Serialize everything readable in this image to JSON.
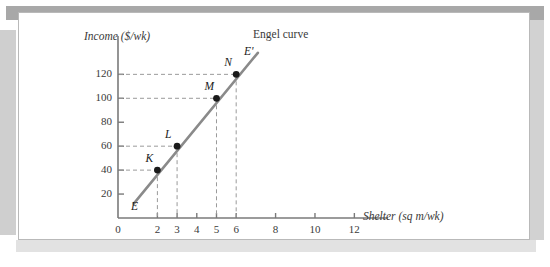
{
  "figure": {
    "background": "#ffffff",
    "frame_color": "#a8a8a8",
    "panel_border": "#b9b9b9"
  },
  "chart_data": {
    "type": "line",
    "title": "",
    "subtitle": "",
    "xlabel": "Shelter (sq m/wk)",
    "ylabel": "Income ($/wk)",
    "xlim": [
      0,
      13.2
    ],
    "ylim": [
      0,
      137
    ],
    "grid": false,
    "legend": "none",
    "line_color": "#8a8a8a",
    "point_color": "#1a1a1a",
    "guide_color": "#9a9a9a",
    "axis_color": "#7a7a7a",
    "xticks": [
      0,
      2,
      3,
      4,
      5,
      6,
      8,
      10,
      12
    ],
    "xtick_labels": [
      "0",
      "2",
      "3",
      "4",
      "5",
      "6",
      "8",
      "10",
      "12"
    ],
    "yticks": [
      20,
      40,
      60,
      80,
      100,
      120
    ],
    "ytick_labels": [
      "20",
      "40",
      "60",
      "80",
      "100",
      "120"
    ],
    "series": [
      {
        "name": "Engel curve",
        "label": "Engel curve",
        "start_label": "E",
        "end_label": "E'",
        "line_from": [
          0.8,
          12
        ],
        "line_to": [
          7.1,
          138
        ],
        "points": [
          {
            "label": "K",
            "x": 2,
            "y": 40
          },
          {
            "label": "L",
            "x": 3,
            "y": 60
          },
          {
            "label": "M",
            "x": 5,
            "y": 100
          },
          {
            "label": "N",
            "x": 6,
            "y": 120
          }
        ]
      }
    ],
    "annotations": [
      {
        "text": "Engel curve",
        "x": 7.3,
        "y": 136
      },
      {
        "text": "E'",
        "x": 7.0,
        "y": 126
      },
      {
        "text": "E",
        "x": 1.45,
        "y": 14
      }
    ]
  }
}
